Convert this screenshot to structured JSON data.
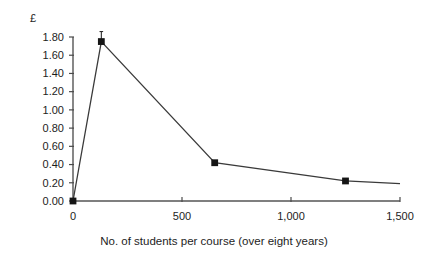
{
  "chart_data": {
    "type": "line",
    "title": "",
    "xlabel": "No. of students per course (over eight years)",
    "ylabel": "£",
    "xlim": [
      0,
      1500
    ],
    "ylim": [
      0.0,
      1.8
    ],
    "grid": false,
    "legend": null,
    "x_ticks": [
      0,
      500,
      1000,
      1500
    ],
    "x_tick_labels": [
      "0",
      "500",
      "1,000",
      "1,500"
    ],
    "y_ticks": [
      0.0,
      0.2,
      0.4,
      0.6,
      0.8,
      1.0,
      1.2,
      1.4,
      1.6,
      1.8
    ],
    "y_tick_labels": [
      "0.00",
      "0.20",
      "0.40",
      "0.60",
      "0.80",
      "1.00",
      "1.20",
      "1.40",
      "1.60",
      "1.80"
    ],
    "series": [
      {
        "name": "Cost per student",
        "marker": "square",
        "color": "#151515",
        "x": [
          0,
          130,
          650,
          1250,
          1500
        ],
        "y": [
          0.0,
          1.75,
          0.42,
          0.22,
          0.19
        ],
        "markers_at": [
          0,
          130,
          650,
          1250
        ]
      }
    ],
    "error_bars": [
      {
        "x": 130,
        "y": 1.75,
        "upper": 1.86,
        "lower": 1.75
      }
    ]
  },
  "axes": {
    "y_axis_title": "£",
    "x_axis_caption": "No. of students per course (over eight years)"
  },
  "colors": {
    "marker": "#151515",
    "line": "#3a3a3a",
    "axis": "#555555",
    "text": "#1d1d1d",
    "background": "#ffffff"
  }
}
